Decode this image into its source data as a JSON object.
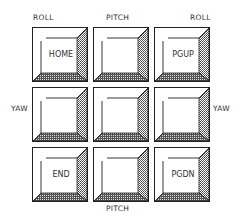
{
  "axis_labels": {
    "top_left": "ROLL",
    "top_center": "PITCH",
    "top_right": "ROLL",
    "middle_left": "YAW",
    "middle_right": "YAW",
    "bottom_center": "PITCH"
  },
  "keys": [
    {
      "label": "HOME"
    },
    {
      "label": ""
    },
    {
      "label": "PGUP"
    },
    {
      "label": ""
    },
    {
      "label": ""
    },
    {
      "label": ""
    },
    {
      "label": "END"
    },
    {
      "label": ""
    },
    {
      "label": "PGDN"
    }
  ],
  "colors": {
    "outline": "#222222",
    "background": "#ffffff"
  }
}
